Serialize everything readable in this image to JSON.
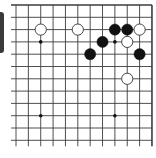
{
  "board": {
    "cols": 12,
    "rows": 12,
    "origin_x": 16,
    "origin_y": 5,
    "spacing_x": 12.36,
    "spacing_y": 12.3,
    "line_color": "#3c3c3c",
    "edge_right": true,
    "edge_top": true,
    "extends_left": true,
    "extends_bottom": true,
    "star_points": [
      [
        2,
        3
      ],
      [
        8,
        3
      ],
      [
        2,
        9
      ],
      [
        8,
        9
      ]
    ]
  },
  "stones": [
    {
      "color": "white",
      "col": 2,
      "row": 2
    },
    {
      "color": "white",
      "col": 5,
      "row": 2
    },
    {
      "color": "black",
      "col": 8,
      "row": 2
    },
    {
      "color": "black",
      "col": 9,
      "row": 2
    },
    {
      "color": "white",
      "col": 10,
      "row": 2
    },
    {
      "color": "black",
      "col": 7,
      "row": 3
    },
    {
      "color": "white",
      "col": 9,
      "row": 3
    },
    {
      "color": "black",
      "col": 6,
      "row": 4
    },
    {
      "color": "black",
      "col": 10,
      "row": 4
    },
    {
      "color": "white",
      "col": 9,
      "row": 6
    }
  ],
  "colors": {
    "black_stone": "#111111",
    "white_stone_fill": "#ffffff",
    "white_stone_stroke": "#333333",
    "side_bar": "#3a3a3a"
  }
}
